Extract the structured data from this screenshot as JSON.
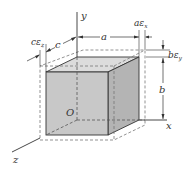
{
  "diagram": {
    "labels": {
      "y_axis": "y",
      "x_axis": "x",
      "z_axis": "z",
      "origin": "O",
      "dim_a": "a",
      "dim_b": "b",
      "dim_c": "c",
      "delta_a": "aε",
      "delta_a_sub": "x",
      "delta_b": "bε",
      "delta_b_sub": "y",
      "delta_c": "cε",
      "delta_c_sub": "z"
    },
    "colors": {
      "front_face": "#c9c9c9",
      "top_face": "#dadada",
      "side_face": "#b3b3b3",
      "edge": "#333333",
      "dashed": "#777777"
    }
  }
}
